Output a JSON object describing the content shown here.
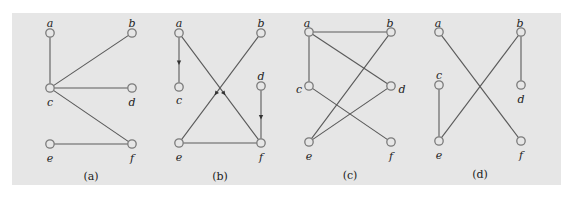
{
  "colors": {
    "background": "#e6e6e6",
    "edge": "#5a5a5a",
    "node_stroke": "#7a7a7a",
    "text": "#222222"
  },
  "graphs": [
    {
      "id": "a",
      "caption": "(a)",
      "directed": false,
      "nodes": [
        {
          "id": "a",
          "label": "a",
          "x": 50,
          "y": 33,
          "lx": 50,
          "ly": 24
        },
        {
          "id": "b",
          "label": "b",
          "x": 132,
          "y": 33,
          "lx": 132,
          "ly": 24
        },
        {
          "id": "c",
          "label": "c",
          "x": 50,
          "y": 88,
          "lx": 50,
          "ly": 103
        },
        {
          "id": "d",
          "label": "d",
          "x": 132,
          "y": 88,
          "lx": 132,
          "ly": 103
        },
        {
          "id": "e",
          "label": "e",
          "x": 50,
          "y": 144,
          "lx": 50,
          "ly": 159
        },
        {
          "id": "f",
          "label": "f",
          "x": 132,
          "y": 144,
          "lx": 132,
          "ly": 159
        }
      ],
      "edges": [
        [
          "a",
          "c"
        ],
        [
          "b",
          "c"
        ],
        [
          "c",
          "d"
        ],
        [
          "c",
          "f"
        ],
        [
          "e",
          "f"
        ]
      ],
      "caption_pos": {
        "x": 91,
        "y": 180
      }
    },
    {
      "id": "b",
      "caption": "(b)",
      "directed": true,
      "nodes": [
        {
          "id": "a",
          "label": "a",
          "x": 179,
          "y": 33,
          "lx": 179,
          "ly": 24
        },
        {
          "id": "b",
          "label": "b",
          "x": 261,
          "y": 33,
          "lx": 261,
          "ly": 24
        },
        {
          "id": "c",
          "label": "c",
          "x": 179,
          "y": 87,
          "lx": 179,
          "ly": 101
        },
        {
          "id": "d",
          "label": "d",
          "x": 261,
          "y": 86,
          "lx": 261,
          "ly": 77
        },
        {
          "id": "e",
          "label": "e",
          "x": 179,
          "y": 143,
          "lx": 179,
          "ly": 158
        },
        {
          "id": "f",
          "label": "f",
          "x": 261,
          "y": 143,
          "lx": 261,
          "ly": 158
        }
      ],
      "edges": [
        [
          "a",
          "c",
          true
        ],
        [
          "a",
          "f",
          true
        ],
        [
          "b",
          "e",
          true
        ],
        [
          "d",
          "f",
          true
        ],
        [
          "e",
          "f",
          false
        ]
      ],
      "caption_pos": {
        "x": 220,
        "y": 180
      }
    },
    {
      "id": "c",
      "caption": "(c)",
      "directed": false,
      "nodes": [
        {
          "id": "a",
          "label": "a",
          "x": 309,
          "y": 32,
          "lx": 307,
          "ly": 24
        },
        {
          "id": "b",
          "label": "b",
          "x": 391,
          "y": 32,
          "lx": 390,
          "ly": 24
        },
        {
          "id": "c",
          "label": "c",
          "x": 309,
          "y": 86,
          "lx": 299,
          "ly": 90
        },
        {
          "id": "d",
          "label": "d",
          "x": 391,
          "y": 86,
          "lx": 402,
          "ly": 90
        },
        {
          "id": "e",
          "label": "e",
          "x": 309,
          "y": 142,
          "lx": 309,
          "ly": 157
        },
        {
          "id": "f",
          "label": "f",
          "x": 391,
          "y": 142,
          "lx": 391,
          "ly": 157
        }
      ],
      "edges": [
        [
          "a",
          "b"
        ],
        [
          "a",
          "c"
        ],
        [
          "a",
          "d"
        ],
        [
          "b",
          "e"
        ],
        [
          "c",
          "f"
        ],
        [
          "d",
          "e"
        ]
      ],
      "caption_pos": {
        "x": 350,
        "y": 179
      }
    },
    {
      "id": "d",
      "caption": "(d)",
      "directed": false,
      "nodes": [
        {
          "id": "a",
          "label": "a",
          "x": 439,
          "y": 32,
          "lx": 438,
          "ly": 24
        },
        {
          "id": "b",
          "label": "b",
          "x": 521,
          "y": 32,
          "lx": 520,
          "ly": 24
        },
        {
          "id": "c",
          "label": "c",
          "x": 439,
          "y": 85,
          "lx": 439,
          "ly": 76
        },
        {
          "id": "d",
          "label": "d",
          "x": 521,
          "y": 85,
          "lx": 521,
          "ly": 100
        },
        {
          "id": "e",
          "label": "e",
          "x": 439,
          "y": 141,
          "lx": 439,
          "ly": 156
        },
        {
          "id": "f",
          "label": "f",
          "x": 521,
          "y": 141,
          "lx": 521,
          "ly": 156
        }
      ],
      "edges": [
        [
          "a",
          "f"
        ],
        [
          "b",
          "d"
        ],
        [
          "b",
          "e"
        ],
        [
          "c",
          "e"
        ]
      ],
      "caption_pos": {
        "x": 480,
        "y": 178
      }
    }
  ]
}
